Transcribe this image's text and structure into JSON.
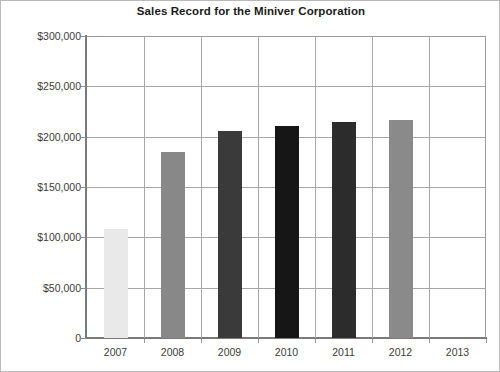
{
  "chart_data": {
    "type": "bar",
    "title": "Sales Record for the Miniver Corporation",
    "xlabel": "",
    "ylabel": "",
    "categories": [
      "2007",
      "2008",
      "2009",
      "2010",
      "2011",
      "2012",
      "2013"
    ],
    "values": [
      108000,
      185000,
      206000,
      211000,
      215000,
      217000,
      0
    ],
    "value_labels": [
      "$108,000",
      "$185,000",
      "$206,000",
      "$211,000",
      "$215,000",
      "$217,000",
      ""
    ],
    "ylim": [
      0,
      300000
    ],
    "ytick_values": [
      300000,
      250000,
      200000,
      150000,
      100000,
      50000,
      0
    ],
    "ytick_labels": [
      "$300,000",
      "$250,000",
      "$200,000",
      "$150,000",
      "$100,000",
      "$50,000",
      "0"
    ],
    "grid": "horizontal-and-vertical",
    "legend": "none",
    "bar_colors": [
      "#e9e9e9",
      "#888888",
      "#3a3a3a",
      "#161616",
      "#2c2c2c",
      "#8a8a8a",
      "#ffffff"
    ],
    "series": [
      {
        "name": "Sales",
        "values": [
          108000,
          185000,
          206000,
          211000,
          215000,
          217000,
          0
        ]
      }
    ]
  },
  "axes": {
    "y_axis_name": "sales-axis",
    "x_axis_name": "year-axis"
  }
}
